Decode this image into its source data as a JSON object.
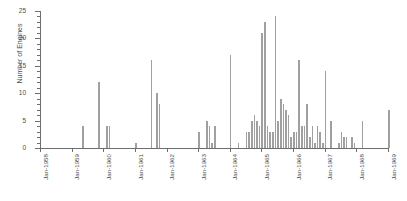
{
  "chart_data": {
    "type": "bar",
    "title": "",
    "xlabel": "",
    "ylabel": "Number of Engines",
    "ylim": [
      0,
      25
    ],
    "ytick_labels": [
      "0",
      "5",
      "10",
      "15",
      "20",
      "25"
    ],
    "ytick_values": [
      0,
      5,
      10,
      15,
      20,
      25
    ],
    "y_minor_tick_step": 1,
    "grid": false,
    "legend": null,
    "bar_color": "#a0a0a0",
    "axis_color": "#6e6e6e",
    "text_color": "#4d4d4d",
    "xtick_labels": [
      "Jan-1958",
      "Jan-1959",
      "Jan-1960",
      "Jan-1961",
      "Jan-1962",
      "Jan-1963",
      "Jan-1964",
      "Jan-1965",
      "Jan-1966",
      "Jan-1967",
      "Jan-1968",
      "Jan-1969"
    ],
    "xtick_values": [
      0,
      12,
      24,
      36,
      48,
      60,
      72,
      84,
      96,
      108,
      120,
      132
    ],
    "xlim": [
      0,
      132
    ],
    "x_unit": "month index from Jan-1958",
    "categories": [
      "Jan-1958",
      "Feb-1958",
      "Mar-1958",
      "Apr-1958",
      "May-1958",
      "Jun-1958",
      "Jul-1958",
      "Aug-1958",
      "Sep-1958",
      "Oct-1958",
      "Nov-1958",
      "Dec-1958",
      "Jan-1959",
      "Feb-1959",
      "Mar-1959",
      "Apr-1959",
      "May-1959",
      "Jun-1959",
      "Jul-1959",
      "Aug-1959",
      "Sep-1959",
      "Oct-1959",
      "Nov-1959",
      "Dec-1959",
      "Jan-1960",
      "Feb-1960",
      "Mar-1960",
      "Apr-1960",
      "May-1960",
      "Jun-1960",
      "Jul-1960",
      "Aug-1960",
      "Sep-1960",
      "Oct-1960",
      "Nov-1960",
      "Dec-1960",
      "Jan-1961",
      "Feb-1961",
      "Mar-1961",
      "Apr-1961",
      "May-1961",
      "Jun-1961",
      "Jul-1961",
      "Aug-1961",
      "Sep-1961",
      "Oct-1961",
      "Nov-1961",
      "Dec-1961",
      "Jan-1962",
      "Feb-1962",
      "Mar-1962",
      "Apr-1962",
      "May-1962",
      "Jun-1962",
      "Jul-1962",
      "Aug-1962",
      "Sep-1962",
      "Oct-1962",
      "Nov-1962",
      "Dec-1962",
      "Jan-1963",
      "Feb-1963",
      "Mar-1963",
      "Apr-1963",
      "May-1963",
      "Jun-1963",
      "Jul-1963",
      "Aug-1963",
      "Sep-1963",
      "Oct-1963",
      "Nov-1963",
      "Dec-1963",
      "Jan-1964",
      "Feb-1964",
      "Mar-1964",
      "Apr-1964",
      "May-1964",
      "Jun-1964",
      "Jul-1964",
      "Aug-1964",
      "Sep-1964",
      "Oct-1964",
      "Nov-1964",
      "Dec-1964",
      "Jan-1965",
      "Feb-1965",
      "Mar-1965",
      "Apr-1965",
      "May-1965",
      "Jun-1965",
      "Jul-1965",
      "Aug-1965",
      "Sep-1965",
      "Oct-1965",
      "Nov-1965",
      "Dec-1965",
      "Jan-1966",
      "Feb-1966",
      "Mar-1966",
      "Apr-1966",
      "May-1966",
      "Jun-1966",
      "Jul-1966",
      "Aug-1966",
      "Sep-1966",
      "Oct-1966",
      "Nov-1966",
      "Dec-1966",
      "Jan-1967",
      "Feb-1967",
      "Mar-1967",
      "Apr-1967",
      "May-1967",
      "Jun-1967",
      "Jul-1967",
      "Aug-1967",
      "Sep-1967",
      "Oct-1967",
      "Nov-1967",
      "Dec-1967",
      "Jan-1968",
      "Feb-1968",
      "Mar-1968",
      "Apr-1968",
      "May-1968",
      "Jun-1968",
      "Jul-1968",
      "Aug-1968",
      "Sep-1968",
      "Oct-1968",
      "Nov-1968",
      "Dec-1968",
      "Jan-1969"
    ],
    "values": [
      0,
      0,
      0,
      0,
      0,
      0,
      0,
      0,
      0,
      0,
      0,
      0,
      0,
      0,
      0,
      0,
      4,
      0,
      0,
      0,
      0,
      0,
      12,
      0,
      0,
      4,
      4,
      0,
      0,
      0,
      0,
      0,
      0,
      0,
      0,
      0,
      1,
      0,
      0,
      0,
      0,
      0,
      16,
      0,
      10,
      8,
      0,
      0,
      0,
      0,
      0,
      0,
      0,
      0,
      0,
      0,
      0,
      0,
      0,
      0,
      3,
      0,
      0,
      5,
      4,
      1,
      4,
      0,
      0,
      0,
      0,
      0,
      17,
      0,
      0,
      1,
      0,
      0,
      3,
      3,
      5,
      6,
      5,
      4,
      21,
      23,
      4,
      3,
      3,
      24,
      5,
      9,
      8,
      7,
      6,
      2,
      3,
      3,
      16,
      4,
      4,
      8,
      2,
      4,
      1,
      4,
      3,
      1,
      14,
      0,
      5,
      0,
      0,
      1,
      3,
      2,
      2,
      0,
      2,
      1,
      0,
      0,
      5,
      0,
      0,
      0,
      0,
      0,
      0,
      0,
      0,
      0,
      7
    ]
  }
}
